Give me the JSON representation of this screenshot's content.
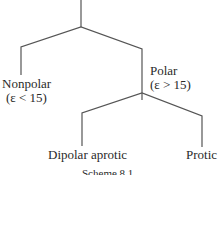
{
  "diagram": {
    "type": "tree",
    "nodes": {
      "nonpolar": {
        "label": "Nonpolar",
        "condition": "(ε < 15)"
      },
      "polar": {
        "label": "Polar",
        "condition": "(ε > 15)"
      },
      "dipolar_aprotic": {
        "label": "Dipolar aprotic"
      },
      "protic": {
        "label": "Protic"
      }
    },
    "edges": [
      {
        "from": "root",
        "to": "nonpolar"
      },
      {
        "from": "root",
        "to": "polar"
      },
      {
        "from": "polar",
        "to": "dipolar_aprotic"
      },
      {
        "from": "polar",
        "to": "protic"
      }
    ],
    "caption": "Scheme 8.1",
    "line_color": "#555555"
  }
}
